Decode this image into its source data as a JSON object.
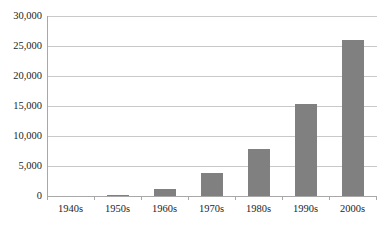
{
  "chart_data": {
    "type": "bar",
    "title": "",
    "subtitle": "",
    "xlabel": "",
    "ylabel": "",
    "categories": [
      "1940s",
      "1950s",
      "1960s",
      "1970s",
      "1980s",
      "1990s",
      "2000s"
    ],
    "values": [
      0,
      150,
      1100,
      3800,
      7900,
      15400,
      26000
    ],
    "ylim": [
      0,
      30000
    ],
    "yticks": [
      0,
      5000,
      10000,
      15000,
      20000,
      25000,
      30000
    ],
    "ytick_labels": [
      "0",
      "5,000",
      "10,000",
      "15,000",
      "20,000",
      "25,000",
      "30,000"
    ],
    "grid": true,
    "grid_axis": "y",
    "legend": false,
    "legend_position": "none",
    "series": [
      {
        "name": "",
        "values": [
          0,
          150,
          1100,
          3800,
          7900,
          15400,
          26000
        ],
        "color": "#808080"
      }
    ],
    "colors": {
      "bar": "#808080",
      "gridline": "#c9c9c9",
      "axis": "#a8a8a8",
      "text": "#1d1d1d",
      "background": "#ffffff"
    },
    "annotations": []
  }
}
